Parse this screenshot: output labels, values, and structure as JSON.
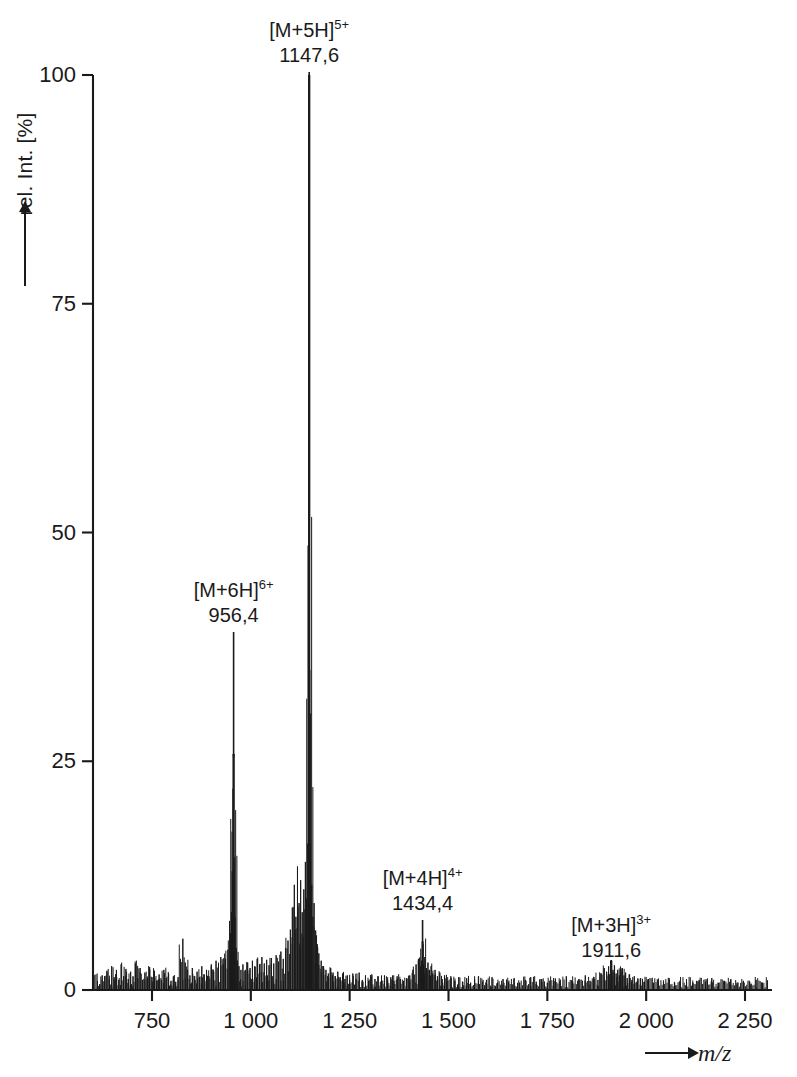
{
  "figure": {
    "background_color": "#ffffff",
    "trace_color": "#1a1a1a"
  },
  "axes": {
    "y": {
      "label": "rel. Int. [%]",
      "arrow_icon": "up-arrow-icon",
      "ticks": [
        "0",
        "25",
        "50",
        "75",
        "100"
      ],
      "tick_values": [
        0,
        25,
        50,
        75,
        100
      ],
      "range": [
        0,
        104
      ]
    },
    "x": {
      "label": "m/z",
      "arrow_icon": "right-arrow-icon",
      "ticks": [
        "750",
        "1 000",
        "1 250",
        "1 500",
        "1 750",
        "2 000",
        "2 250"
      ],
      "tick_values": [
        750,
        1000,
        1250,
        1500,
        1750,
        2000,
        2250
      ],
      "range": [
        600,
        2310
      ]
    }
  },
  "annotations": [
    {
      "id": "peak-5plus",
      "ion": "[M+5H]",
      "charge": "5+",
      "mz_label": "1147,6",
      "mz": 1147.6,
      "intensity": 100
    },
    {
      "id": "peak-6plus",
      "ion": "[M+6H]",
      "charge": "6+",
      "mz_label": "956,4",
      "mz": 956.4,
      "intensity": 25.8
    },
    {
      "id": "peak-4plus",
      "ion": "[M+4H]",
      "charge": "4+",
      "mz_label": "1434,4",
      "mz": 1434.4,
      "intensity": 5.3
    },
    {
      "id": "peak-3plus",
      "ion": "[M+3H]",
      "charge": "3+",
      "mz_label": "1911,6",
      "mz": 1911.6,
      "intensity": 3.2
    }
  ],
  "chart_data": {
    "type": "line",
    "title": "",
    "xlabel": "m/z",
    "ylabel": "rel. Int. [%]",
    "xlim": [
      600,
      2310
    ],
    "ylim": [
      0,
      104
    ],
    "grid": false,
    "legend": null,
    "xticks": [
      750,
      1000,
      1250,
      1500,
      1750,
      2000,
      2250
    ],
    "yticks": [
      0,
      25,
      50,
      75,
      100
    ],
    "labelled_peaks": [
      {
        "mz": 956.4,
        "intensity": 25.8,
        "label": "[M+6H]6+"
      },
      {
        "mz": 1147.6,
        "intensity": 100,
        "label": "[M+5H]5+"
      },
      {
        "mz": 1434.4,
        "intensity": 5.3,
        "label": "[M+4H]4+"
      },
      {
        "mz": 1911.6,
        "intensity": 3.2,
        "label": "[M+3H]3+"
      }
    ],
    "peaks": [
      [
        612,
        1.0
      ],
      [
        618,
        0.6
      ],
      [
        624,
        1.6
      ],
      [
        630,
        0.9
      ],
      [
        636,
        2.1
      ],
      [
        642,
        1.2
      ],
      [
        648,
        2.6
      ],
      [
        654,
        1.4
      ],
      [
        660,
        2.2
      ],
      [
        666,
        1.1
      ],
      [
        672,
        2.8
      ],
      [
        678,
        1.5
      ],
      [
        684,
        2.3
      ],
      [
        690,
        1.2
      ],
      [
        696,
        2.0
      ],
      [
        702,
        1.5
      ],
      [
        708,
        2.9
      ],
      [
        714,
        1.3
      ],
      [
        720,
        2.4
      ],
      [
        726,
        1.1
      ],
      [
        732,
        1.9
      ],
      [
        738,
        1.3
      ],
      [
        744,
        2.5
      ],
      [
        750,
        1.4
      ],
      [
        756,
        2.1
      ],
      [
        762,
        1.0
      ],
      [
        768,
        1.7
      ],
      [
        774,
        1.1
      ],
      [
        780,
        2.2
      ],
      [
        786,
        1.3
      ],
      [
        792,
        1.8
      ],
      [
        798,
        1.0
      ],
      [
        804,
        1.5
      ],
      [
        810,
        0.9
      ],
      [
        816,
        1.4
      ],
      [
        822,
        3.4
      ],
      [
        828,
        5.6
      ],
      [
        834,
        3.0
      ],
      [
        840,
        2.2
      ],
      [
        846,
        1.6
      ],
      [
        852,
        2.4
      ],
      [
        858,
        1.5
      ],
      [
        864,
        2.0
      ],
      [
        870,
        1.4
      ],
      [
        876,
        2.6
      ],
      [
        882,
        1.7
      ],
      [
        888,
        2.2
      ],
      [
        894,
        1.5
      ],
      [
        900,
        2.8
      ],
      [
        906,
        2.0
      ],
      [
        912,
        3.2
      ],
      [
        918,
        2.4
      ],
      [
        924,
        3.6
      ],
      [
        930,
        2.8
      ],
      [
        936,
        3.4
      ],
      [
        942,
        4.4
      ],
      [
        948,
        6.2
      ],
      [
        951,
        8.5
      ],
      [
        953,
        13.0
      ],
      [
        955,
        22.0
      ],
      [
        956.4,
        25.8
      ],
      [
        958,
        14.5
      ],
      [
        960,
        8.0
      ],
      [
        963,
        4.6
      ],
      [
        966,
        3.2
      ],
      [
        970,
        2.6
      ],
      [
        975,
        2.2
      ],
      [
        980,
        2.8
      ],
      [
        986,
        2.2
      ],
      [
        992,
        3.0
      ],
      [
        998,
        2.4
      ],
      [
        1004,
        3.2
      ],
      [
        1010,
        2.6
      ],
      [
        1016,
        3.4
      ],
      [
        1022,
        2.8
      ],
      [
        1028,
        3.6
      ],
      [
        1034,
        2.9
      ],
      [
        1040,
        3.3
      ],
      [
        1046,
        2.7
      ],
      [
        1052,
        3.5
      ],
      [
        1058,
        2.9
      ],
      [
        1064,
        3.8
      ],
      [
        1070,
        3.1
      ],
      [
        1076,
        4.2
      ],
      [
        1082,
        3.4
      ],
      [
        1088,
        4.6
      ],
      [
        1094,
        5.4
      ],
      [
        1100,
        6.6
      ],
      [
        1105,
        9.0
      ],
      [
        1110,
        11.5
      ],
      [
        1114,
        8.0
      ],
      [
        1118,
        13.5
      ],
      [
        1122,
        9.5
      ],
      [
        1126,
        12.0
      ],
      [
        1130,
        8.5
      ],
      [
        1134,
        11.0
      ],
      [
        1138,
        14.0
      ],
      [
        1141,
        10.0
      ],
      [
        1144,
        16.0
      ],
      [
        1146,
        30.0
      ],
      [
        1147.6,
        100
      ],
      [
        1149,
        35.0
      ],
      [
        1151,
        16.0
      ],
      [
        1154,
        11.5
      ],
      [
        1157,
        8.0
      ],
      [
        1160,
        9.5
      ],
      [
        1164,
        6.5
      ],
      [
        1168,
        5.0
      ],
      [
        1172,
        4.0
      ],
      [
        1178,
        3.2
      ],
      [
        1184,
        2.6
      ],
      [
        1190,
        2.2
      ],
      [
        1196,
        1.8
      ],
      [
        1202,
        2.4
      ],
      [
        1208,
        1.9
      ],
      [
        1214,
        1.5
      ],
      [
        1220,
        2.0
      ],
      [
        1226,
        1.4
      ],
      [
        1232,
        1.8
      ],
      [
        1238,
        1.2
      ],
      [
        1244,
        1.6
      ],
      [
        1250,
        1.1
      ],
      [
        1258,
        1.8
      ],
      [
        1266,
        1.2
      ],
      [
        1274,
        1.9
      ],
      [
        1282,
        1.1
      ],
      [
        1290,
        1.6
      ],
      [
        1298,
        1.0
      ],
      [
        1306,
        1.7
      ],
      [
        1314,
        1.2
      ],
      [
        1322,
        1.5
      ],
      [
        1330,
        1.0
      ],
      [
        1338,
        1.6
      ],
      [
        1346,
        1.1
      ],
      [
        1354,
        1.4
      ],
      [
        1362,
        1.0
      ],
      [
        1370,
        1.5
      ],
      [
        1378,
        1.2
      ],
      [
        1386,
        1.0
      ],
      [
        1394,
        1.3
      ],
      [
        1402,
        1.6
      ],
      [
        1410,
        2.2
      ],
      [
        1418,
        2.8
      ],
      [
        1424,
        3.4
      ],
      [
        1429,
        2.6
      ],
      [
        1432,
        3.2
      ],
      [
        1434.4,
        5.3
      ],
      [
        1437,
        2.8
      ],
      [
        1440,
        3.6
      ],
      [
        1444,
        2.4
      ],
      [
        1448,
        3.0
      ],
      [
        1452,
        2.2
      ],
      [
        1456,
        2.6
      ],
      [
        1460,
        1.8
      ],
      [
        1466,
        2.2
      ],
      [
        1472,
        1.5
      ],
      [
        1478,
        1.9
      ],
      [
        1484,
        1.2
      ],
      [
        1490,
        1.6
      ],
      [
        1496,
        1.0
      ],
      [
        1506,
        1.5
      ],
      [
        1516,
        1.0
      ],
      [
        1526,
        1.4
      ],
      [
        1536,
        0.9
      ],
      [
        1546,
        1.3
      ],
      [
        1556,
        0.8
      ],
      [
        1566,
        1.2
      ],
      [
        1576,
        1.5
      ],
      [
        1586,
        0.9
      ],
      [
        1596,
        1.1
      ],
      [
        1610,
        1.4
      ],
      [
        1624,
        0.8
      ],
      [
        1638,
        1.2
      ],
      [
        1652,
        0.9
      ],
      [
        1666,
        1.3
      ],
      [
        1680,
        0.8
      ],
      [
        1694,
        1.1
      ],
      [
        1708,
        1.4
      ],
      [
        1722,
        0.9
      ],
      [
        1736,
        1.2
      ],
      [
        1750,
        0.8
      ],
      [
        1766,
        1.3
      ],
      [
        1782,
        1.0
      ],
      [
        1798,
        1.5
      ],
      [
        1814,
        0.9
      ],
      [
        1830,
        1.2
      ],
      [
        1846,
        1.6
      ],
      [
        1858,
        1.0
      ],
      [
        1868,
        1.4
      ],
      [
        1878,
        1.1
      ],
      [
        1886,
        1.8
      ],
      [
        1894,
        2.4
      ],
      [
        1900,
        2.0
      ],
      [
        1905,
        2.6
      ],
      [
        1911.6,
        3.2
      ],
      [
        1916,
        2.2
      ],
      [
        1920,
        2.6
      ],
      [
        1924,
        1.8
      ],
      [
        1928,
        2.2
      ],
      [
        1932,
        1.6
      ],
      [
        1936,
        2.0
      ],
      [
        1940,
        2.4
      ],
      [
        1944,
        1.6
      ],
      [
        1948,
        1.9
      ],
      [
        1952,
        1.3
      ],
      [
        1958,
        1.7
      ],
      [
        1964,
        1.1
      ],
      [
        1970,
        1.5
      ],
      [
        1978,
        1.0
      ],
      [
        1986,
        1.3
      ],
      [
        1996,
        0.9
      ],
      [
        2006,
        1.2
      ],
      [
        2018,
        0.8
      ],
      [
        2030,
        1.1
      ],
      [
        2044,
        0.9
      ],
      [
        2058,
        1.3
      ],
      [
        2072,
        0.8
      ],
      [
        2086,
        1.0
      ],
      [
        2102,
        1.2
      ],
      [
        2118,
        0.8
      ],
      [
        2134,
        1.1
      ],
      [
        2150,
        0.9
      ],
      [
        2166,
        1.3
      ],
      [
        2182,
        0.8
      ],
      [
        2198,
        1.0
      ],
      [
        2214,
        1.2
      ],
      [
        2230,
        0.8
      ],
      [
        2246,
        1.0
      ],
      [
        2262,
        0.9
      ],
      [
        2278,
        1.1
      ],
      [
        2294,
        0.8
      ]
    ]
  }
}
